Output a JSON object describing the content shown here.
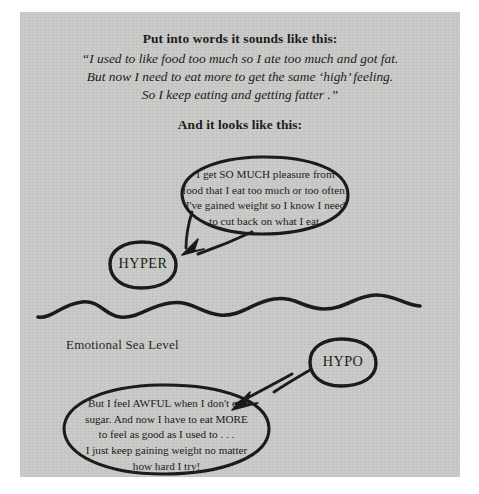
{
  "page": {
    "background_color": "#c9c9c7",
    "ink_color": "#111111"
  },
  "header": {
    "title": "Put into words it sounds like this:",
    "quote_lines": [
      "“I used to like food too much so I ate too much and got fat.",
      "But now I need to eat more to get the same ‘high’ feeling.",
      "So I keep eating and getting fatter .”"
    ],
    "subtitle": "And it looks like this:"
  },
  "diagram": {
    "sea_level_label": "Emotional Sea Level",
    "hyper_label": "HYPER",
    "hypo_label": "HYPO",
    "hyper_bubble": {
      "text": "I get SO MUCH pleasure from\nfood that I eat too much or too often!\nI've gained weight so I know I need\nto cut back on what I eat."
    },
    "hypo_bubble": {
      "text": "But I feel AWFUL when I don't eat\nsugar. And now I have to eat MORE\nto feel as good as I used to . . .\nI just keep gaining weight no matter\nhow hard I try!"
    }
  }
}
